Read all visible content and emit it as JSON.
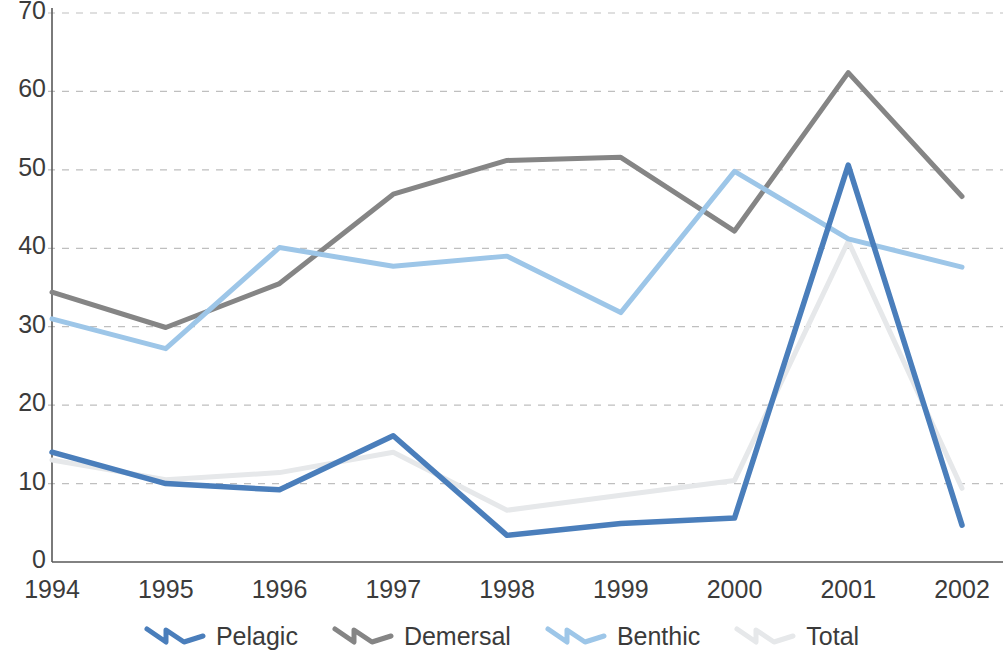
{
  "chart_data": {
    "type": "line",
    "title": "",
    "xlabel": "",
    "ylabel": "",
    "categories": [
      "1994",
      "1995",
      "1996",
      "1997",
      "1998",
      "1999",
      "2000",
      "2001",
      "2002"
    ],
    "ylim": [
      0,
      70
    ],
    "ytick_labels": [
      "0",
      "10",
      "20",
      "30",
      "40",
      "50",
      "60",
      "70"
    ],
    "yticks": [
      0,
      10,
      20,
      30,
      40,
      50,
      60,
      70
    ],
    "grid": "horizontal-dashed",
    "legend_position": "bottom",
    "series": [
      {
        "name": "Pelagic",
        "color": "#4a7ebb",
        "values": [
          14.0,
          10.0,
          9.2,
          16.1,
          3.4,
          4.9,
          5.6,
          50.6,
          4.7
        ]
      },
      {
        "name": "Demersal",
        "color": "#858585",
        "values": [
          34.4,
          29.9,
          35.5,
          46.9,
          51.2,
          51.6,
          42.2,
          62.4,
          46.6
        ]
      },
      {
        "name": "Benthic",
        "color": "#9dc6e8",
        "values": [
          31.0,
          27.2,
          40.1,
          37.7,
          39.0,
          31.8,
          49.8,
          41.2,
          37.6
        ]
      },
      {
        "name": "Total",
        "color": "#e6e8ea",
        "values": [
          13.0,
          10.5,
          11.4,
          14.0,
          6.6,
          8.5,
          10.4,
          40.9,
          9.4
        ]
      }
    ]
  },
  "axes": {
    "axis_color": "#595959",
    "grid_color": "#bfbfbf",
    "tick_text_color": "#3b3b3b"
  }
}
